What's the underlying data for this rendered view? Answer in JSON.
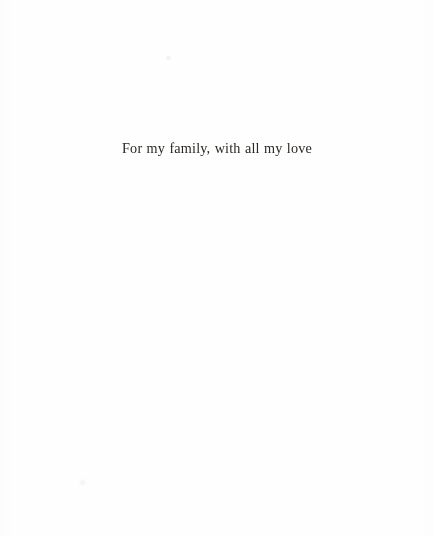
{
  "page": {
    "kind": "book-dedication-page",
    "width": 434,
    "height": 536,
    "background_color": "#fefefe",
    "ink_color": "#2a2824"
  },
  "dedication": {
    "text": "For my family, with all my love"
  },
  "artifacts": {
    "speck_upper": "",
    "speck_lower": ""
  }
}
